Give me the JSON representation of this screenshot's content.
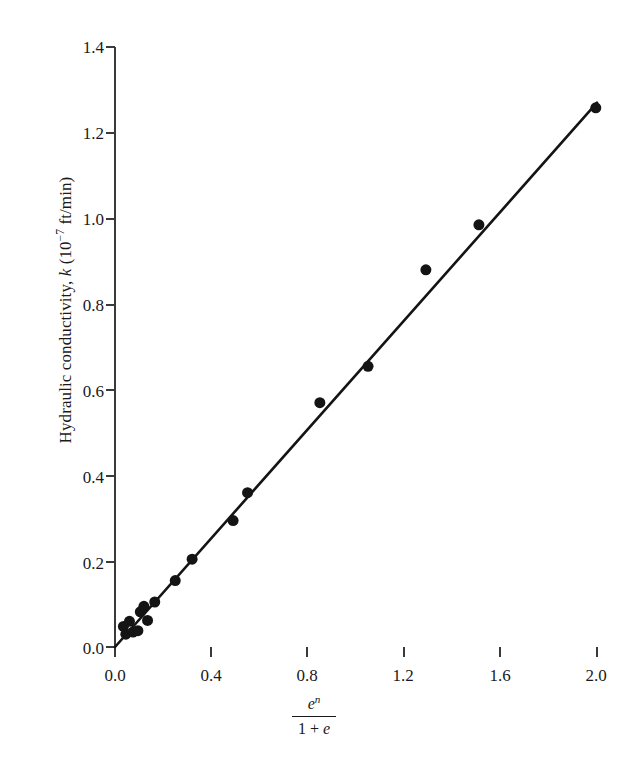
{
  "chart_data": {
    "type": "scatter",
    "title": "",
    "subtitle": "",
    "xlabel_parts": {
      "numerator": "e",
      "numerator_exponent": "n",
      "denominator_lead": "1 + ",
      "denominator_italic": "e"
    },
    "ylabel_parts": {
      "lead": "Hydraulic conductivity, ",
      "symbol": "k",
      "units_open": " (10",
      "units_exponent": "−7",
      "units_rest": " ft/min)"
    },
    "xlabel": "e^n / (1 + e)",
    "ylabel": "Hydraulic conductivity, k (10^-7 ft/min)",
    "xlim": [
      0.0,
      2.0
    ],
    "ylim": [
      0.0,
      1.4
    ],
    "xticks": [
      0.0,
      0.4,
      0.8,
      1.2,
      1.6,
      2.0
    ],
    "yticks": [
      0.0,
      0.2,
      0.4,
      0.6,
      0.8,
      1.0,
      1.2,
      1.4
    ],
    "xtick_labels": [
      "0.0",
      "0.4",
      "0.8",
      "1.2",
      "1.6",
      "2.0"
    ],
    "ytick_labels": [
      "0.0",
      "0.2",
      "0.4",
      "0.6",
      "0.8",
      "1.0",
      "1.2",
      "1.4"
    ],
    "grid": false,
    "legend": false,
    "marker": "filled-circle",
    "marker_color": "#141414",
    "marker_size_px": 11,
    "line_color": "#141414",
    "line_width_px": 2.6,
    "points": [
      {
        "x": 0.035,
        "y": 0.048
      },
      {
        "x": 0.045,
        "y": 0.03
      },
      {
        "x": 0.06,
        "y": 0.06
      },
      {
        "x": 0.075,
        "y": 0.035
      },
      {
        "x": 0.095,
        "y": 0.038
      },
      {
        "x": 0.105,
        "y": 0.082
      },
      {
        "x": 0.12,
        "y": 0.095
      },
      {
        "x": 0.135,
        "y": 0.062
      },
      {
        "x": 0.165,
        "y": 0.105
      },
      {
        "x": 0.25,
        "y": 0.155
      },
      {
        "x": 0.32,
        "y": 0.205
      },
      {
        "x": 0.49,
        "y": 0.295
      },
      {
        "x": 0.55,
        "y": 0.36
      },
      {
        "x": 0.85,
        "y": 0.57
      },
      {
        "x": 1.05,
        "y": 0.655
      },
      {
        "x": 1.29,
        "y": 0.88
      },
      {
        "x": 1.51,
        "y": 0.985
      },
      {
        "x": 1.995,
        "y": 1.258
      }
    ],
    "fit_line": {
      "type": "line",
      "x_start": 0.0,
      "y_start": 0.0,
      "x_end": 2.0,
      "y_end": 1.27,
      "slope": 0.635,
      "intercept": 0.0
    }
  }
}
